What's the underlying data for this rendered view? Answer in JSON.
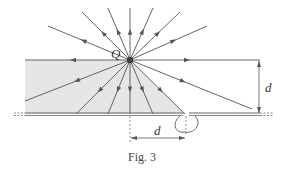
{
  "figure": {
    "caption": "Fig. 3",
    "charge_label": "Q",
    "vertical_distance_label": "d",
    "horizontal_distance_label": "d"
  },
  "colors": {
    "line": "#555555",
    "shade": "#e6e6e6",
    "plate": "#666666",
    "background": "#ffffff"
  },
  "geometry": {
    "charge": {
      "x": 130,
      "y": 60
    },
    "plate_y": 114,
    "hole_x": 185,
    "field_line_endpoints": [
      [
        48,
        26
      ],
      [
        82,
        12
      ],
      [
        108,
        8
      ],
      [
        130,
        8
      ],
      [
        153,
        8
      ],
      [
        180,
        12
      ],
      [
        207,
        26
      ],
      [
        25,
        60
      ],
      [
        260,
        60
      ],
      [
        25,
        101
      ],
      [
        76,
        114
      ],
      [
        108,
        114
      ],
      [
        130,
        114
      ],
      [
        153,
        114
      ],
      [
        185,
        114
      ],
      [
        252,
        109
      ]
    ]
  }
}
